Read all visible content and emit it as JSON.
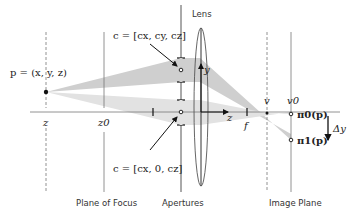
{
  "labels": {
    "lens": "Lens",
    "plane_of_focus": "Plane of Focus",
    "apertures": "Apertures",
    "image_plane": "Image Plane"
  },
  "math": {
    "point_p": "p = (x, y, z)",
    "aperture_top": "c = [cx, cy, cz]",
    "aperture_bottom": "c = [cx, 0, cz]",
    "axis_z_point": "z",
    "axis_z0": "z0",
    "axis_z": "z",
    "axis_y": "y",
    "axis_f": "f",
    "axis_v": "v",
    "axis_v0": "v0",
    "pi0": "π0(p)",
    "pi1": "π1(p)",
    "delta_y": "Δy"
  },
  "colors": {
    "ray_cone": "#cfcfcf",
    "ray_cone_light": "#e2e2e2",
    "lines": "#555555",
    "ink": "#111111"
  }
}
